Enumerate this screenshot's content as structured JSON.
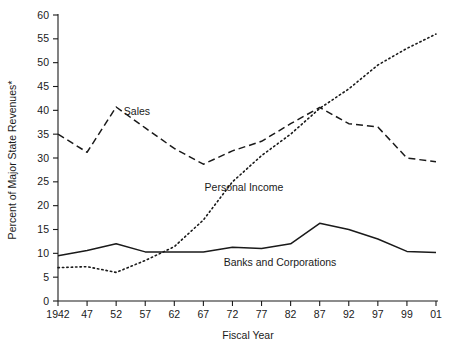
{
  "chart_data": {
    "type": "line",
    "title": "",
    "xlabel": "Fiscal Year",
    "ylabel": "Percent of Major State Revenues*",
    "categories": [
      "1942",
      "47",
      "52",
      "57",
      "62",
      "67",
      "72",
      "77",
      "82",
      "87",
      "92",
      "97",
      "99",
      "01"
    ],
    "ylim": [
      0,
      60
    ],
    "yticks": [
      0,
      5,
      10,
      15,
      20,
      25,
      30,
      35,
      40,
      45,
      50,
      55,
      60
    ],
    "grid": false,
    "legend_position": "inline-annotations",
    "series": [
      {
        "name": "Sales",
        "style": "dashed",
        "values": [
          35.0,
          31.2,
          40.7,
          36.3,
          32.0,
          28.7,
          31.5,
          33.5,
          37.2,
          40.6,
          37.2,
          36.5,
          30.0,
          29.2
        ]
      },
      {
        "name": "Personal Income",
        "style": "dotted",
        "values": [
          7.0,
          7.2,
          6.0,
          8.5,
          11.4,
          17.0,
          25.0,
          30.5,
          35.0,
          40.4,
          44.5,
          49.5,
          53.0,
          56.0
        ]
      },
      {
        "name": "Banks and Corporations",
        "style": "solid",
        "values": [
          9.5,
          10.6,
          12.0,
          10.3,
          10.3,
          10.3,
          11.3,
          11.0,
          12.0,
          16.3,
          15.0,
          13.0,
          10.4,
          10.2
        ]
      }
    ],
    "annotations": [
      {
        "text": "Sales",
        "x_px": 137,
        "y_px": 115
      },
      {
        "text": "Personal Income",
        "x_px": 244,
        "y_px": 191
      },
      {
        "text": "Banks and Corporations",
        "x_px": 280,
        "y_px": 266
      }
    ]
  }
}
